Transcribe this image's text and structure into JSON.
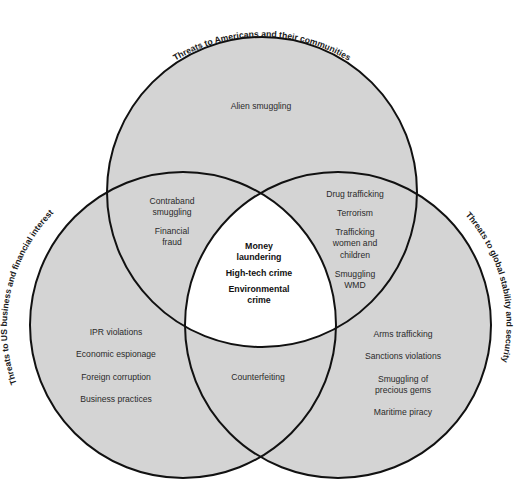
{
  "diagram": {
    "type": "venn-3",
    "colors": {
      "fill": "#d4d4d4",
      "center_fill": "#ffffff",
      "stroke": "#111111",
      "background": "#ffffff"
    },
    "sets": {
      "top": {
        "label": "Threats to Americans and their communities"
      },
      "left": {
        "label": "Threats to US business and financial interest"
      },
      "right": {
        "label": "Threats to global stability and security"
      }
    },
    "regions": {
      "top_only": [
        "Alien smuggling"
      ],
      "top_left": [
        "Contraband",
        "smuggling",
        "Financial",
        "fraud"
      ],
      "top_right": [
        "Drug trafficking",
        "Terrorism",
        "Trafficking",
        "women and",
        "children",
        "Smuggling",
        "WMD"
      ],
      "center": [
        "Money",
        "laundering",
        "High-tech crime",
        "Environmental",
        "crime"
      ],
      "left_only": [
        "IPR violations",
        "Economic espionage",
        "Foreign corruption",
        "Business practices"
      ],
      "left_right": [
        "Counterfeiting"
      ],
      "right_only": [
        "Arms trafficking",
        "Sanctions violations",
        "Smuggling of",
        "precious gems",
        "Maritime piracy"
      ]
    }
  }
}
